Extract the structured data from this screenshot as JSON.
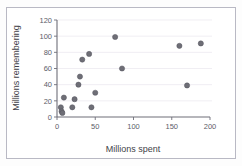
{
  "chart_data": {
    "type": "scatter",
    "title": "",
    "xlabel": "Millions spent",
    "ylabel": "Millions remembering",
    "xlim": [
      0,
      200
    ],
    "ylim": [
      0,
      120
    ],
    "xticks": [
      0,
      50,
      100,
      150,
      200
    ],
    "yticks": [
      0,
      20,
      40,
      60,
      80,
      100,
      120
    ],
    "xtick_labels": [
      "0",
      "50",
      "100",
      "150",
      "200"
    ],
    "ytick_labels": [
      "0",
      "20",
      "40",
      "60",
      "80",
      "100",
      "120"
    ],
    "grid": true,
    "legend": null,
    "marker_color": "#6e6e76",
    "axis_color": "#6e6e78",
    "grid_color": "#e9e6ee",
    "points": [
      {
        "x": 5,
        "y": 12
      },
      {
        "x": 6,
        "y": 7
      },
      {
        "x": 7,
        "y": 5
      },
      {
        "x": 9,
        "y": 24
      },
      {
        "x": 20,
        "y": 12
      },
      {
        "x": 23,
        "y": 22
      },
      {
        "x": 28,
        "y": 40
      },
      {
        "x": 30,
        "y": 50
      },
      {
        "x": 33,
        "y": 71
      },
      {
        "x": 42,
        "y": 78
      },
      {
        "x": 45,
        "y": 12
      },
      {
        "x": 50,
        "y": 30
      },
      {
        "x": 76,
        "y": 99
      },
      {
        "x": 85,
        "y": 60
      },
      {
        "x": 160,
        "y": 88
      },
      {
        "x": 170,
        "y": 39
      },
      {
        "x": 188,
        "y": 91
      }
    ]
  },
  "figure": {
    "xlabel": "Millions spent",
    "ylabel": "Millions remembering"
  }
}
